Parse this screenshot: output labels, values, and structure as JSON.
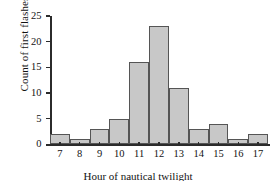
{
  "chart_data": {
    "type": "bar",
    "title": "",
    "xlabel": "Hour of nautical twilight",
    "ylabel": "Count of first flashes",
    "categories": [
      "7",
      "8",
      "9",
      "10",
      "11",
      "12",
      "13",
      "14",
      "15",
      "16",
      "17"
    ],
    "values": [
      2,
      1,
      3,
      5,
      16,
      23,
      11,
      3,
      4,
      1,
      2
    ],
    "ylim": [
      0,
      25
    ],
    "yticks": [
      "0",
      "5",
      "10",
      "15",
      "20",
      "25"
    ],
    "ytick_values": [
      0,
      5,
      10,
      15,
      20,
      25
    ],
    "grid": false,
    "legend": false,
    "bar_fill_color": "#c8c8c8",
    "bar_edge_color": "#555555",
    "axis_color": "#2b2b2b",
    "background_color": "#ffffff"
  }
}
